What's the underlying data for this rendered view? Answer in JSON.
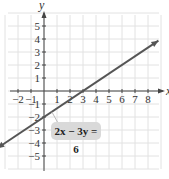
{
  "chart_data": {
    "type": "line",
    "title": "",
    "xlabel": "x",
    "ylabel": "y",
    "xlim": [
      -3,
      9
    ],
    "ylim": [
      -6,
      6
    ],
    "grid": true,
    "x_ticks": [
      "-2",
      "-1",
      "1",
      "2",
      "3",
      "4",
      "5",
      "6",
      "7",
      "8"
    ],
    "y_ticks": [
      "5",
      "4",
      "3",
      "2",
      "1",
      "-1",
      "-2",
      "-3",
      "-4",
      "-5"
    ],
    "series": [
      {
        "name": "2x - 3y = 6",
        "equation": "y = (2/3)x - 2",
        "x": [
          -3.6,
          0,
          3,
          8.8
        ],
        "y": [
          -4.4,
          -2,
          0,
          3.87
        ],
        "color": "#555555",
        "arrows": "both"
      }
    ],
    "annotations": [
      {
        "text": "2x − 3y = 6",
        "points_to": [
          0.6,
          -1.6
        ]
      }
    ],
    "intercepts": {
      "x": [
        3,
        0
      ],
      "y": [
        0,
        -2
      ]
    }
  },
  "labels": {
    "x_axis": "x",
    "y_axis": "y",
    "equation": "2x − 3y = 6"
  }
}
